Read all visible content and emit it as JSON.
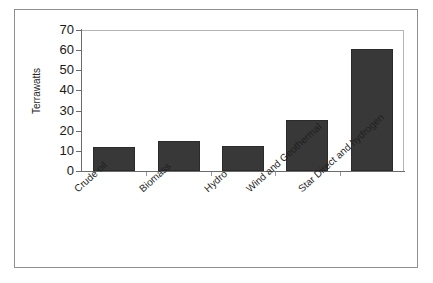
{
  "chart_data": {
    "type": "bar",
    "title": "",
    "xlabel": "",
    "ylabel": "Terrawatts",
    "ylim": [
      0,
      70
    ],
    "ytick_step": 10,
    "yticks": [
      "70",
      "60",
      "50",
      "40",
      "30",
      "20",
      "10",
      "0"
    ],
    "grid": false,
    "legend": "none",
    "categories": [
      "Crude oil",
      "Biomass",
      "Hydro",
      "Wind and Geothermal",
      "Star Direct and hydrogen"
    ],
    "values": [
      12,
      15,
      12.5,
      25.5,
      60.5
    ],
    "bar_color": "#383838",
    "axis_color": "#6b6b6b",
    "plot_border_color": "#b4b4b4",
    "frame_border_color": "#8f8f8f",
    "background_color": "#ffffff"
  },
  "figure": {
    "y_axis_title": "Terrawatts"
  }
}
